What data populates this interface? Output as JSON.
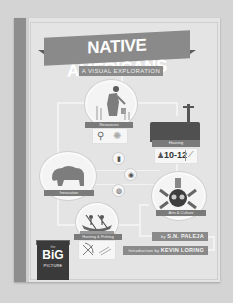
{
  "cover": {
    "title": "NATIVE AMERICANS",
    "subtitle": "A VISUAL EXPLORATION",
    "sections": [
      {
        "label": "Resources",
        "icons": [
          "mortar-pestle-icon",
          "sun-icon"
        ]
      },
      {
        "label": "Housing",
        "badge_value": "10-12",
        "icons": [
          "person-icon",
          "feather-icon"
        ]
      },
      {
        "label": "Innovation"
      },
      {
        "label": "Arts & Culture"
      },
      {
        "label": "Hunting & Fishing",
        "icons": [
          "bow-arrow-icon",
          "arrows-icon"
        ]
      }
    ],
    "small_icons": [
      "bottle-icon",
      "fish-icon",
      "basket-icon"
    ],
    "author_prefix": "by",
    "author": "S.N. PALEJA",
    "intro_prefix": "Introduction by",
    "intro_author": "KEVIN LORING",
    "series_badge": {
      "top": "the",
      "main": "BiG",
      "bottom": "PICTURE"
    }
  },
  "colors": {
    "background": "#d4d4d4",
    "cover": "#e4e4e4",
    "banner": "#8a8a8a",
    "label": "#7a7a7a",
    "badge": "#3a3a3a"
  }
}
